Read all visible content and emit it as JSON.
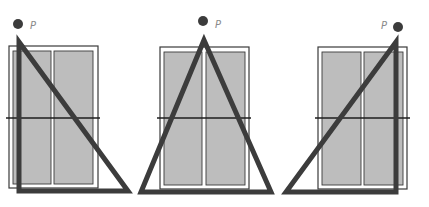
{
  "diagram": {
    "colors": {
      "pane": "#bdbdbd",
      "frame": "#3a3a3a",
      "triangle": "#3c3c3c",
      "point": "#3c3c3c",
      "label": "#8a8a8a"
    },
    "panels": [
      {
        "id": "left",
        "point_label": "P",
        "frame": {
          "x": 9,
          "y": 46,
          "w": 89,
          "h": 142
        },
        "panes": [
          {
            "x": 13,
            "y": 51,
            "w": 38,
            "h": 133
          },
          {
            "x": 54,
            "y": 51,
            "w": 39,
            "h": 133
          }
        ],
        "horizon": {
          "x1": 6,
          "x2": 100,
          "y": 118
        },
        "triangle": [
          [
            19,
            42
          ],
          [
            19,
            191
          ],
          [
            128,
            191
          ]
        ],
        "point": {
          "cx": 18,
          "cy": 24
        },
        "label_pos": {
          "x": 30,
          "y": 29
        }
      },
      {
        "id": "center",
        "point_label": "P",
        "frame": {
          "x": 160,
          "y": 47,
          "w": 89,
          "h": 142
        },
        "panes": [
          {
            "x": 164,
            "y": 52,
            "w": 38,
            "h": 133
          },
          {
            "x": 206,
            "y": 52,
            "w": 39,
            "h": 133
          }
        ],
        "horizon": {
          "x1": 157,
          "x2": 251,
          "y": 118
        },
        "triangle": [
          [
            204,
            40
          ],
          [
            141,
            192
          ],
          [
            271,
            192
          ]
        ],
        "point": {
          "cx": 203,
          "cy": 21
        },
        "label_pos": {
          "x": 215,
          "y": 28
        }
      },
      {
        "id": "right",
        "point_label": "P",
        "frame": {
          "x": 318,
          "y": 47,
          "w": 89,
          "h": 142
        },
        "panes": [
          {
            "x": 322,
            "y": 52,
            "w": 39,
            "h": 133
          },
          {
            "x": 364,
            "y": 52,
            "w": 39,
            "h": 133
          }
        ],
        "horizon": {
          "x1": 315,
          "x2": 410,
          "y": 118
        },
        "triangle": [
          [
            396,
            42
          ],
          [
            286,
            192
          ],
          [
            396,
            192
          ]
        ],
        "point": {
          "cx": 398,
          "cy": 27
        },
        "label_pos": {
          "x": 381,
          "y": 29
        }
      }
    ]
  }
}
